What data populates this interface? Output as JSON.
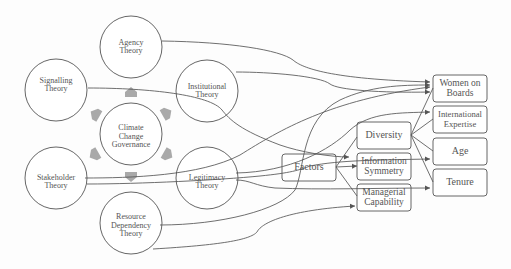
{
  "diagram": {
    "colors": {
      "stroke": "#555555",
      "arrow_fill": "#a9a9a9",
      "text": "#555555",
      "background": "#fdfdfd"
    },
    "center": {
      "id": "ccg",
      "label": "Climate\nChange\nGovernance"
    },
    "theories": [
      {
        "id": "agency",
        "label": "Agency\nTheory"
      },
      {
        "id": "signalling",
        "label": "Signalling\nTheory"
      },
      {
        "id": "institutional",
        "label": "Institutional\nTheory"
      },
      {
        "id": "stakeholder",
        "label": "Stakeholder\nTheory"
      },
      {
        "id": "legitimacy",
        "label": "Legitimacy\nTheory"
      },
      {
        "id": "resource",
        "label": "Resource\nDependency\nTheory"
      }
    ],
    "middle_boxes": [
      {
        "id": "factors",
        "label": "Factors"
      },
      {
        "id": "diversity",
        "label": "Diversity"
      },
      {
        "id": "info",
        "label": "Information\nSymmetry"
      },
      {
        "id": "managerial",
        "label": "Managerial\nCapability"
      }
    ],
    "outcome_boxes": [
      {
        "id": "women",
        "label": "Women on\nBoards"
      },
      {
        "id": "intl",
        "label": "International\nExpertise"
      },
      {
        "id": "age",
        "label": "Age"
      },
      {
        "id": "tenure",
        "label": "Tenure"
      }
    ],
    "center_arrows": [
      "up",
      "upper-left",
      "upper-right",
      "lower-left",
      "lower-right",
      "down"
    ]
  }
}
